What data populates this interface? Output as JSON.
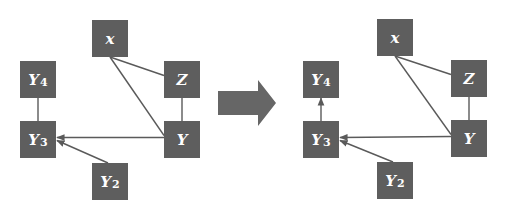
{
  "colors": {
    "node_fill": "#5e5e5e",
    "node_text": "#ffffff",
    "edge": "#5a5a5a",
    "transform_arrow": "#666666",
    "background": "#ffffff"
  },
  "diagrams": [
    {
      "name": "before",
      "nodes": [
        {
          "id": "x",
          "label": "x",
          "sub": "",
          "x": 92,
          "y": 20
        },
        {
          "id": "Z",
          "label": "Z",
          "sub": "",
          "x": 164,
          "y": 61
        },
        {
          "id": "Y4",
          "label": "Y",
          "sub": "4",
          "x": 20,
          "y": 61
        },
        {
          "id": "Y3",
          "label": "Y",
          "sub": "3",
          "x": 20,
          "y": 121
        },
        {
          "id": "Y",
          "label": "Y",
          "sub": "",
          "x": 164,
          "y": 121
        },
        {
          "id": "Y2",
          "label": "Y",
          "sub": "2",
          "x": 92,
          "y": 163
        }
      ],
      "edges": [
        {
          "from": "x",
          "to": "Z",
          "directed": false
        },
        {
          "from": "x",
          "to": "Y",
          "directed": false
        },
        {
          "from": "Z",
          "to": "Y",
          "directed": false
        },
        {
          "from": "Y4",
          "to": "Y3",
          "directed": false
        },
        {
          "from": "Y",
          "to": "Y3",
          "directed": true
        },
        {
          "from": "Y2",
          "to": "Y3",
          "directed": true
        }
      ]
    },
    {
      "name": "after",
      "nodes": [
        {
          "id": "x",
          "label": "x",
          "sub": "",
          "x": 377,
          "y": 19
        },
        {
          "id": "Z",
          "label": "Z",
          "sub": "",
          "x": 451,
          "y": 60
        },
        {
          "id": "Y4",
          "label": "Y",
          "sub": "4",
          "x": 303,
          "y": 61
        },
        {
          "id": "Y3",
          "label": "Y",
          "sub": "3",
          "x": 303,
          "y": 121
        },
        {
          "id": "Y",
          "label": "Y",
          "sub": "",
          "x": 451,
          "y": 120
        },
        {
          "id": "Y2",
          "label": "Y",
          "sub": "2",
          "x": 377,
          "y": 162
        }
      ],
      "edges": [
        {
          "from": "x",
          "to": "Z",
          "directed": false
        },
        {
          "from": "x",
          "to": "Y",
          "directed": false
        },
        {
          "from": "Z",
          "to": "Y",
          "directed": false
        },
        {
          "from": "Y3",
          "to": "Y4",
          "directed": true
        },
        {
          "from": "Y",
          "to": "Y3",
          "directed": true
        },
        {
          "from": "Y2",
          "to": "Y3",
          "directed": true
        }
      ]
    }
  ],
  "transform_arrow": {
    "direction": "right"
  }
}
